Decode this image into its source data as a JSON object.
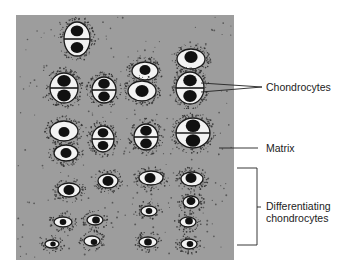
{
  "figure": {
    "panel": {
      "x": 16,
      "y": 15,
      "width": 218,
      "height": 245,
      "fill": "#9d9d9d"
    },
    "colors": {
      "matrix": "#9d9d9d",
      "lacuna": "#f2f2f2",
      "nucleus": "#111111",
      "outline": "#1a1a1a",
      "stipple": "#3a3a3a",
      "leader_line": "#222222"
    },
    "labels": {
      "chondrocytes": "Chondrocytes",
      "matrix": "Matrix",
      "differentiating_line1": "Differentiating",
      "differentiating_line2": "chondrocytes"
    },
    "cells": [
      {
        "type": "pair",
        "cx": 77,
        "cy": 39,
        "rx": 13,
        "ry": 17
      },
      {
        "type": "single",
        "cx": 145,
        "cy": 71,
        "rx": 13,
        "ry": 9,
        "nx": 145,
        "ny": 70,
        "nr": 5
      },
      {
        "type": "single",
        "cx": 191,
        "cy": 59,
        "rx": 14,
        "ry": 10,
        "nx": 191,
        "ny": 57,
        "nr": 6
      },
      {
        "type": "pair",
        "cx": 64,
        "cy": 88,
        "rx": 14,
        "ry": 15
      },
      {
        "type": "pair",
        "cx": 104,
        "cy": 90,
        "rx": 12,
        "ry": 13
      },
      {
        "type": "single",
        "cx": 142,
        "cy": 91,
        "rx": 14,
        "ry": 10,
        "nx": 142,
        "ny": 91,
        "nr": 6
      },
      {
        "type": "pair",
        "cx": 190,
        "cy": 88,
        "rx": 14,
        "ry": 16
      },
      {
        "type": "single",
        "cx": 64,
        "cy": 131,
        "rx": 14,
        "ry": 10,
        "nx": 64,
        "ny": 132,
        "nr": 5
      },
      {
        "type": "single",
        "cx": 66,
        "cy": 153,
        "rx": 12,
        "ry": 8,
        "nx": 66,
        "ny": 153,
        "nr": 5
      },
      {
        "type": "pair",
        "cx": 103,
        "cy": 139,
        "rx": 11,
        "ry": 13
      },
      {
        "type": "pair",
        "cx": 146,
        "cy": 137,
        "rx": 12,
        "ry": 13
      },
      {
        "type": "pair",
        "cx": 193,
        "cy": 133,
        "rx": 17,
        "ry": 15
      },
      {
        "type": "single",
        "cx": 108,
        "cy": 181,
        "rx": 10,
        "ry": 7,
        "nx": 108,
        "ny": 181,
        "nr": 5
      },
      {
        "type": "single",
        "cx": 151,
        "cy": 178,
        "rx": 12,
        "ry": 7,
        "nx": 150,
        "ny": 178,
        "nr": 5
      },
      {
        "type": "single",
        "cx": 192,
        "cy": 179,
        "rx": 11,
        "ry": 7,
        "nx": 191,
        "ny": 178,
        "nr": 5
      },
      {
        "type": "single",
        "cx": 69,
        "cy": 190,
        "rx": 11,
        "ry": 7,
        "nx": 69,
        "ny": 190,
        "nr": 5
      },
      {
        "type": "single",
        "cx": 191,
        "cy": 202,
        "rx": 8,
        "ry": 6,
        "nx": 191,
        "ny": 201,
        "nr": 4
      },
      {
        "type": "single",
        "cx": 149,
        "cy": 211,
        "rx": 8,
        "ry": 5,
        "nx": 149,
        "ny": 211,
        "nr": 3
      },
      {
        "type": "single",
        "cx": 63,
        "cy": 222,
        "rx": 9,
        "ry": 5,
        "nx": 63,
        "ny": 222,
        "nr": 3
      },
      {
        "type": "single",
        "cx": 95,
        "cy": 220,
        "rx": 8,
        "ry": 5,
        "nx": 96,
        "ny": 220,
        "nr": 3.5
      },
      {
        "type": "single",
        "cx": 188,
        "cy": 222,
        "rx": 8,
        "ry": 5,
        "nx": 189,
        "ny": 221,
        "nr": 3.5
      },
      {
        "type": "single",
        "cx": 52,
        "cy": 244,
        "rx": 7,
        "ry": 4,
        "nx": 53,
        "ny": 244,
        "nr": 2.5
      },
      {
        "type": "single",
        "cx": 92,
        "cy": 241,
        "rx": 8,
        "ry": 5,
        "nx": 94,
        "ny": 242,
        "nr": 3
      },
      {
        "type": "single",
        "cx": 148,
        "cy": 242,
        "rx": 9,
        "ry": 5,
        "nx": 148,
        "ny": 242,
        "nr": 3.5
      },
      {
        "type": "single",
        "cx": 189,
        "cy": 244,
        "rx": 8,
        "ry": 5,
        "nx": 190,
        "ny": 244,
        "nr": 3
      }
    ],
    "leaders": {
      "chondrocytes": [
        {
          "x1": 201,
          "y1": 83,
          "x2": 262,
          "y2": 87
        },
        {
          "x1": 201,
          "y1": 92,
          "x2": 262,
          "y2": 87
        }
      ],
      "matrix": {
        "x1": 219,
        "y1": 148,
        "x2": 258,
        "y2": 148
      },
      "bracket": {
        "x_left": 237,
        "x_right": 257,
        "y_top": 168,
        "y_bottom": 245,
        "tick_y": 207
      }
    }
  }
}
